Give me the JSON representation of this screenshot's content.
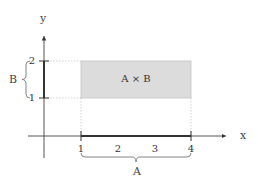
{
  "diagram": {
    "type": "cartesian-product",
    "axes": {
      "x_label": "x",
      "y_label": "y"
    },
    "x_ticks": [
      "1",
      "2",
      "3",
      "4"
    ],
    "y_ticks": [
      "1",
      "2"
    ],
    "set_A": {
      "label": "A",
      "interval": [
        1,
        4
      ]
    },
    "set_B": {
      "label": "B",
      "interval": [
        1,
        2
      ]
    },
    "product_label": "A × B",
    "colors": {
      "rect_fill": "#dcdcdc",
      "axis": "#333333",
      "guide": "#bbbbbb",
      "text": "#444444"
    }
  }
}
